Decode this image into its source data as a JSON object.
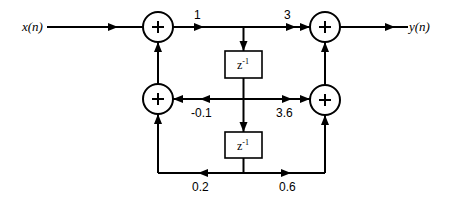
{
  "diagram": {
    "type": "signal-flow block diagram (direct-form II, second order IIR filter)",
    "input": {
      "label": "x(n)"
    },
    "output": {
      "label": "y(n)"
    },
    "delays": [
      {
        "id": "delay-1",
        "label": "z",
        "exponent": "-1"
      },
      {
        "id": "delay-2",
        "label": "z",
        "exponent": "-1"
      }
    ],
    "adders": [
      {
        "id": "adder-top-left",
        "symbol": "+"
      },
      {
        "id": "adder-bottom-left",
        "symbol": "+"
      },
      {
        "id": "adder-top-right",
        "symbol": "+"
      },
      {
        "id": "adder-bottom-right",
        "symbol": "+"
      }
    ],
    "gains": {
      "b0": "1",
      "b0_out": "3",
      "a1": "-0.1",
      "b1": "3.6",
      "a2": "0.2",
      "b2": "0.6"
    },
    "colors": {
      "stroke": "#000000",
      "background": "#ffffff"
    }
  }
}
